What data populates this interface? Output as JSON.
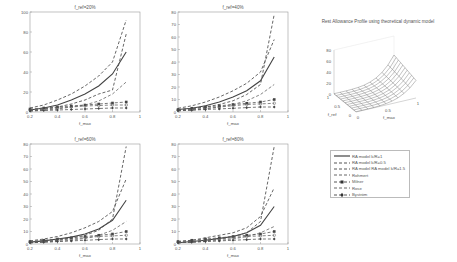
{
  "figure": {
    "surface_title": "Rest Allowance Profile using theoretical dynamic model"
  },
  "legend": {
    "items": [
      {
        "label": "RA model k/R=1",
        "style": "solid",
        "marker": "none"
      },
      {
        "label": "RA model k/R=0.5",
        "style": "dashed",
        "marker": "none"
      },
      {
        "label": "RA model RA model k/R=1.5",
        "style": "dashed",
        "marker": "none"
      },
      {
        "label": "Rohmert",
        "style": "dashed",
        "marker": "none"
      },
      {
        "label": "Milner",
        "style": "dashed",
        "marker": "square-filled"
      },
      {
        "label": "Rose",
        "style": "dashed",
        "marker": "none"
      },
      {
        "label": "Byström",
        "style": "dashed",
        "marker": "diamond-filled"
      }
    ]
  },
  "chart_data": [
    {
      "type": "line",
      "title": "f_ref=20%",
      "xlabel": "f_max",
      "ylabel": "",
      "xlim": [
        0.2,
        1
      ],
      "ylim": [
        0,
        100
      ],
      "xticks": [
        "0.2",
        "0.4",
        "0.6",
        "0.8",
        "1"
      ],
      "yticks": [
        "0",
        "20",
        "40",
        "60",
        "80",
        "100"
      ],
      "grid": false,
      "x": [
        0.2,
        0.3,
        0.4,
        0.5,
        0.6,
        0.7,
        0.8,
        0.9
      ],
      "series": [
        {
          "name": "RA model k/R=1",
          "values": [
            2,
            4,
            7,
            12,
            18,
            26,
            38,
            60
          ]
        },
        {
          "name": "RA model k/R=0.5",
          "values": [
            4,
            7,
            12,
            18,
            26,
            36,
            50,
            92
          ]
        },
        {
          "name": "RA model RA model k/R=1.5",
          "values": [
            1.5,
            3,
            5,
            8,
            12,
            18,
            22,
            78
          ]
        },
        {
          "name": "Rohmert",
          "values": [
            1,
            2,
            3,
            5,
            7,
            11,
            18,
            30
          ]
        },
        {
          "name": "Milner",
          "values": [
            3,
            4,
            5,
            6,
            7,
            8,
            9,
            10
          ]
        },
        {
          "name": "Rose",
          "values": [
            2,
            3,
            4,
            5,
            6,
            6.5,
            7,
            7
          ]
        },
        {
          "name": "Byström",
          "values": [
            1,
            1.5,
            2,
            2.5,
            3,
            3.5,
            4,
            4
          ]
        }
      ]
    },
    {
      "type": "line",
      "title": "f_ref=40%",
      "xlabel": "f_max",
      "ylabel": "",
      "xlim": [
        0.2,
        1
      ],
      "ylim": [
        0,
        80
      ],
      "xticks": [
        "0.2",
        "0.4",
        "0.6",
        "0.8",
        "1"
      ],
      "yticks": [
        "0",
        "10",
        "20",
        "30",
        "40",
        "50",
        "60",
        "70",
        "80"
      ],
      "grid": false,
      "x": [
        0.2,
        0.3,
        0.4,
        0.5,
        0.6,
        0.7,
        0.8,
        0.9
      ],
      "series": [
        {
          "name": "RA model k/R=1",
          "values": [
            2,
            3,
            5,
            8,
            12,
            17,
            25,
            44
          ]
        },
        {
          "name": "RA model k/R=0.5",
          "values": [
            3,
            5,
            8,
            12,
            17,
            23,
            32,
            58
          ]
        },
        {
          "name": "RA model RA model k/R=1.5",
          "values": [
            1.5,
            2.5,
            4,
            6,
            9,
            14,
            22,
            78
          ]
        },
        {
          "name": "Rohmert",
          "values": [
            1,
            1.5,
            2.5,
            4,
            6,
            9,
            14,
            22
          ]
        },
        {
          "name": "Milner",
          "values": [
            2,
            3,
            4,
            5,
            6,
            7,
            8,
            10
          ]
        },
        {
          "name": "Rose",
          "values": [
            1.5,
            2,
            3,
            4,
            5,
            6,
            6.5,
            7
          ]
        },
        {
          "name": "Byström",
          "values": [
            1,
            1.5,
            2,
            2.5,
            3,
            3.5,
            4,
            4
          ]
        }
      ]
    },
    {
      "type": "line",
      "title": "f_ref=60%",
      "xlabel": "f_max",
      "ylabel": "",
      "xlim": [
        0.2,
        1
      ],
      "ylim": [
        0,
        80
      ],
      "xticks": [
        "0.2",
        "0.4",
        "0.6",
        "0.8",
        "1"
      ],
      "yticks": [
        "0",
        "10",
        "20",
        "30",
        "40",
        "50",
        "60",
        "70",
        "80"
      ],
      "grid": false,
      "x": [
        0.2,
        0.3,
        0.4,
        0.5,
        0.6,
        0.7,
        0.8,
        0.9
      ],
      "series": [
        {
          "name": "RA model k/R=1",
          "values": [
            1.5,
            2.5,
            4,
            5.5,
            8,
            12,
            19,
            35
          ]
        },
        {
          "name": "RA model k/R=0.5",
          "values": [
            2.5,
            4,
            6,
            9,
            13,
            18,
            26,
            52
          ]
        },
        {
          "name": "RA model RA model k/R=1.5",
          "values": [
            1,
            2,
            3,
            5,
            7,
            11,
            20,
            78
          ]
        },
        {
          "name": "Rohmert",
          "values": [
            1,
            1.5,
            2,
            3,
            4.5,
            7,
            11,
            18
          ]
        },
        {
          "name": "Milner",
          "values": [
            2,
            3,
            4,
            5,
            6,
            7,
            8,
            10
          ]
        },
        {
          "name": "Rose",
          "values": [
            1.5,
            2,
            3,
            4,
            5,
            6,
            6.5,
            7
          ]
        },
        {
          "name": "Byström",
          "values": [
            1,
            1.5,
            2,
            2.5,
            3,
            3.5,
            4,
            4
          ]
        }
      ]
    },
    {
      "type": "line",
      "title": "f_ref=80%",
      "xlabel": "f_max",
      "ylabel": "",
      "xlim": [
        0.2,
        1
      ],
      "ylim": [
        0,
        80
      ],
      "xticks": [
        "0.2",
        "0.4",
        "0.6",
        "0.8",
        "1"
      ],
      "yticks": [
        "0",
        "10",
        "20",
        "30",
        "40",
        "50",
        "60",
        "70",
        "80"
      ],
      "grid": false,
      "x": [
        0.2,
        0.3,
        0.4,
        0.5,
        0.6,
        0.7,
        0.8,
        0.9
      ],
      "series": [
        {
          "name": "RA model k/R=1",
          "values": [
            1,
            2,
            3,
            4.5,
            6,
            9,
            15,
            30
          ]
        },
        {
          "name": "RA model k/R=0.5",
          "values": [
            2,
            3,
            5,
            7,
            9,
            13,
            22,
            45
          ]
        },
        {
          "name": "RA model RA model k/R=1.5",
          "values": [
            1,
            1.5,
            2.5,
            4,
            6,
            9,
            18,
            78
          ]
        },
        {
          "name": "Rohmert",
          "values": [
            1,
            1.5,
            2,
            3,
            4,
            6,
            9,
            14
          ]
        },
        {
          "name": "Milner",
          "values": [
            2,
            3,
            4,
            5,
            6,
            7,
            8,
            10
          ]
        },
        {
          "name": "Rose",
          "values": [
            1.5,
            2,
            3,
            4,
            5,
            6,
            6.5,
            7
          ]
        },
        {
          "name": "Byström",
          "values": [
            1,
            1.5,
            2,
            2.5,
            3,
            3.5,
            4,
            4
          ]
        }
      ]
    },
    {
      "type": "surface",
      "title": "Rest Allowance Profile using theoretical dynamic model",
      "xlabel": "f_max",
      "ylabel": "f_ref",
      "zlabel": "",
      "xlim": [
        0,
        1
      ],
      "ylim": [
        0,
        1
      ],
      "zlim": [
        0,
        80
      ],
      "xticks": [
        "0",
        "0.5",
        "1"
      ],
      "yticks": [
        "0",
        "0.5",
        "1"
      ],
      "zticks": [
        "0",
        "20",
        "40",
        "60",
        "80"
      ]
    }
  ]
}
